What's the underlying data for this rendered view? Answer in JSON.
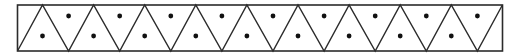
{
  "diagram": {
    "canvas": {
      "width": 521,
      "height": 56
    },
    "colors": {
      "stroke": "#2b2b2b",
      "fill": "#ffffff",
      "dot": "#111111"
    },
    "frame": {
      "x": 17.5,
      "y": 5,
      "width": 485,
      "height": 46,
      "stroke_width": 1.6
    },
    "grid": {
      "top_apex_x": [
        42.5,
        93.6,
        144.7,
        195.8,
        246.9,
        298.0,
        349.1,
        400.2,
        451.3,
        502.4
      ],
      "bottom_vertex_x": [
        17.5,
        68.6,
        119.7,
        170.8,
        221.9,
        273.0,
        324.1,
        375.2,
        426.3,
        477.4
      ],
      "line_width": 1.4
    },
    "dots": {
      "radius": 2.4,
      "upward_triangle_dots": [
        {
          "x": 42.5,
          "y": 36
        },
        {
          "x": 93.6,
          "y": 36
        },
        {
          "x": 144.7,
          "y": 36
        },
        {
          "x": 195.8,
          "y": 36
        },
        {
          "x": 246.9,
          "y": 36
        },
        {
          "x": 298.0,
          "y": 36
        },
        {
          "x": 349.1,
          "y": 36
        },
        {
          "x": 400.2,
          "y": 36
        },
        {
          "x": 451.3,
          "y": 36
        }
      ],
      "downward_triangle_dots": [
        {
          "x": 68.6,
          "y": 16
        },
        {
          "x": 119.7,
          "y": 16
        },
        {
          "x": 170.8,
          "y": 16
        },
        {
          "x": 221.9,
          "y": 16
        },
        {
          "x": 273.0,
          "y": 16
        },
        {
          "x": 324.1,
          "y": 16
        },
        {
          "x": 375.2,
          "y": 16
        },
        {
          "x": 426.3,
          "y": 16
        },
        {
          "x": 477.4,
          "y": 16
        }
      ]
    },
    "counts": {
      "upward_triangles": 9,
      "downward_triangles": 9,
      "corner_half_triangles": 2,
      "dots": 18
    }
  }
}
